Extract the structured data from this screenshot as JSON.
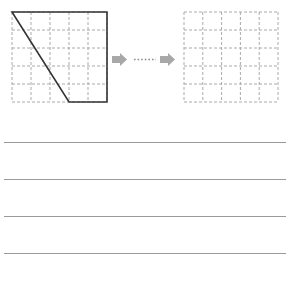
{
  "figure": {
    "left_grid": {
      "rows": 5,
      "cols": 5,
      "x": 12,
      "y": 12,
      "width": 95,
      "height": 90,
      "grid_color": "#aaaaaa",
      "shape": {
        "description": "trapezoid",
        "vertices_grid_units": [
          [
            0,
            0
          ],
          [
            5,
            0
          ],
          [
            5,
            5
          ],
          [
            3,
            5
          ]
        ],
        "stroke_color": "#333333"
      }
    },
    "arrow": {
      "icons": [
        "arrow-right-icon",
        "dotted-line",
        "arrow-right-icon"
      ],
      "color": "#aaaaaa"
    },
    "right_grid": {
      "rows": 5,
      "cols": 5,
      "x": 184,
      "y": 12,
      "width": 94,
      "height": 90,
      "grid_color": "#aaaaaa"
    }
  },
  "answer_lines": {
    "count": 4,
    "y_positions": [
      142,
      179,
      216,
      253
    ],
    "color": "#9a9a9a"
  }
}
